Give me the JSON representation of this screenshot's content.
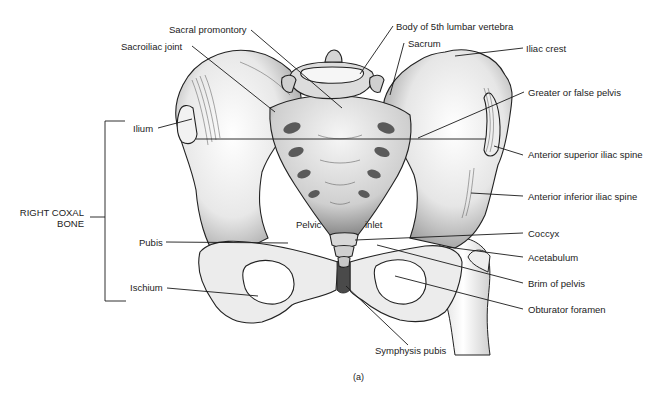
{
  "figure": {
    "caption": "(a)",
    "group_label": {
      "line1": "RIGHT COXAL",
      "line2": "BONE"
    },
    "labels": {
      "sacral_promontory": "Sacral promontory",
      "sacroiliac_joint": "Sacroiliac joint",
      "body_5th_lumbar": "Body of 5th lumbar vertebra",
      "sacrum": "Sacrum",
      "iliac_crest": "Iliac crest",
      "greater_false_pelvis": "Greater or false pelvis",
      "ilium": "Ilium",
      "anterior_superior_iliac_spine": "Anterior superior iliac spine",
      "anterior_inferior_iliac_spine": "Anterior inferior iliac spine",
      "pelvic": "Pelvic",
      "inlet": "inlet",
      "pubis": "Pubis",
      "coccyx": "Coccyx",
      "acetabulum": "Acetabulum",
      "brim_of_pelvis": "Brim of pelvis",
      "ischium": "Ischium",
      "obturator_foramen": "Obturator foramen",
      "symphysis_pubis": "Symphysis pubis"
    },
    "colors": {
      "ink": "#1a1a1a",
      "bone_light": "#f4f4f4",
      "bone_shade": "#bdbdbd",
      "bone_dark": "#6e6e6e",
      "background": "#ffffff"
    }
  }
}
